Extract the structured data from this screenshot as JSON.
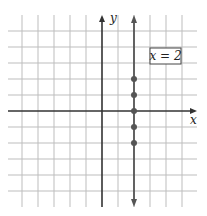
{
  "chart_data": {
    "type": "scatter",
    "title": "",
    "xlabel": "x",
    "ylabel": "y",
    "xlim": [
      -6,
      6
    ],
    "ylim": [
      -6,
      6
    ],
    "grid": true,
    "annotation": "x = 2",
    "series": [
      {
        "name": "x = 2",
        "line": "vertical line x = 2 with arrows both ends",
        "points": [
          {
            "x": 2,
            "y": 2
          },
          {
            "x": 2,
            "y": 1
          },
          {
            "x": 2,
            "y": 0
          },
          {
            "x": 2,
            "y": -1
          },
          {
            "x": 2,
            "y": -2
          }
        ]
      }
    ]
  },
  "labels": {
    "x_axis": "x",
    "y_axis": "y",
    "equation": "x = 2"
  },
  "colors": {
    "grid": "#bdbdbd",
    "axis": "#333333",
    "line": "#555555",
    "point": "#555555"
  }
}
